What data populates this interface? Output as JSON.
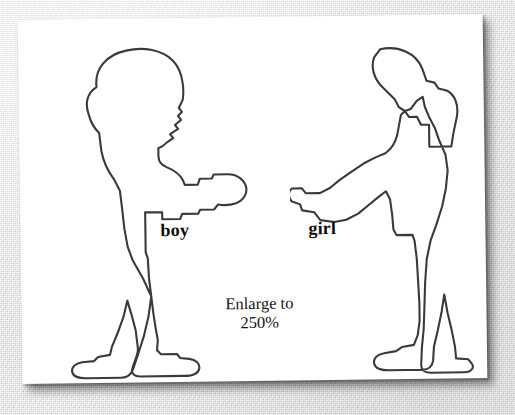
{
  "document": {
    "type": "scanned-worksheet",
    "orientation": "landscape",
    "paper_color": "#ffffff",
    "ink_color": "#3a3a3a",
    "background_color": "#dcdcdc",
    "shadow_color": "#000000"
  },
  "figures": [
    {
      "id": "boy",
      "label": "boy",
      "description": "outline silhouette of a boy standing in profile facing right with arm extended",
      "facing": "right",
      "position": "left"
    },
    {
      "id": "girl",
      "label": "girl",
      "description": "outline silhouette of a girl with a ponytail standing in profile facing left with arm extended",
      "facing": "left",
      "position": "right"
    }
  ],
  "labels": {
    "boy": "boy",
    "girl": "girl"
  },
  "note": {
    "line1": "Enlarge to",
    "line2": "250%",
    "full_text": "Enlarge to 250%",
    "scale_percent": "250%"
  }
}
